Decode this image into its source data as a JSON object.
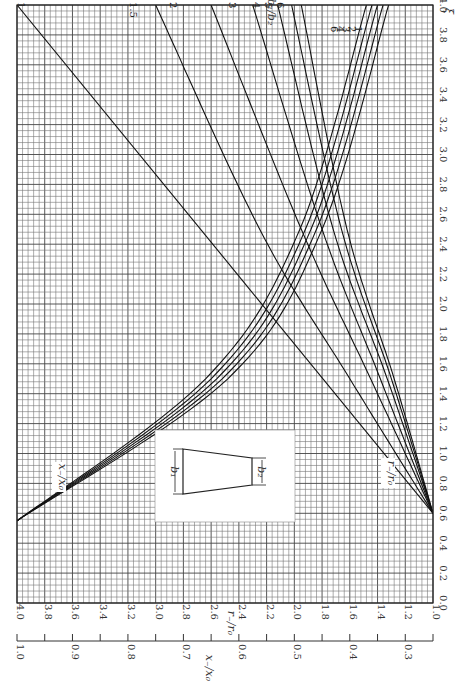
{
  "chart_data": {
    "type": "line",
    "title": "",
    "orientation": "rotated 90° (read with xi axis along right edge)",
    "xi_axis": {
      "label": "ξ",
      "range": [
        0.0,
        4.0
      ],
      "ticks": [
        "0.0",
        "0.2",
        "0.4",
        "0.6",
        "0.8",
        "1.0",
        "1.2",
        "1.4",
        "1.6",
        "1.8",
        "2.0",
        "2.2",
        "2.4",
        "2.6",
        "2.8",
        "3.0",
        "3.2",
        "3.4",
        "3.6",
        "3.8",
        "4.0"
      ]
    },
    "r_axis": {
      "label": "r₋/r₀",
      "range": [
        1.0,
        4.0
      ],
      "ticks": [
        "4.0",
        "3.8",
        "3.6",
        "3.4",
        "3.2",
        "3.0",
        "2.8",
        "2.6",
        "2.4",
        "2.2",
        "2.0",
        "1.8",
        "1.6",
        "1.4",
        "1.2",
        "1.0"
      ]
    },
    "x_axis": {
      "label": "x₋/x₀",
      "range": [
        0.25,
        1.0
      ],
      "ticks": [
        "1.0",
        "0.9",
        "0.8",
        "0.7",
        "0.6",
        "0.5",
        "0.4",
        "0.3"
      ]
    },
    "parameter": {
      "label": "b₁/b₂",
      "values": [
        "1",
        "1.5",
        "2",
        "3",
        "4",
        "5",
        "6"
      ]
    },
    "series_r": [
      {
        "name": "b1/b2=1",
        "xi": [
          0.6,
          4.0
        ],
        "r_over_r0": [
          1.0,
          4.0
        ]
      },
      {
        "name": "b1/b2=1.5",
        "xi": [
          0.6,
          1.5,
          2.5,
          4.0
        ],
        "r_over_r0": [
          1.0,
          1.6,
          2.25,
          3.0
        ]
      },
      {
        "name": "b1/b2=2",
        "xi": [
          0.6,
          1.5,
          2.5,
          4.0
        ],
        "r_over_r0": [
          1.0,
          1.45,
          1.95,
          2.6
        ]
      },
      {
        "name": "b1/b2=3",
        "xi": [
          0.6,
          1.5,
          2.5,
          4.0
        ],
        "r_over_r0": [
          1.0,
          1.38,
          1.8,
          2.3
        ]
      },
      {
        "name": "b1/b2=4",
        "xi": [
          0.6,
          1.5,
          2.5,
          4.0
        ],
        "r_over_r0": [
          1.0,
          1.33,
          1.72,
          2.12
        ]
      },
      {
        "name": "b1/b2=5",
        "xi": [
          0.6,
          1.5,
          2.5,
          4.0
        ],
        "r_over_r0": [
          1.0,
          1.3,
          1.66,
          2.02
        ]
      },
      {
        "name": "b1/b2=6",
        "xi": [
          0.6,
          1.5,
          2.5,
          4.0
        ],
        "r_over_r0": [
          1.0,
          1.28,
          1.62,
          1.95
        ]
      }
    ],
    "series_x": [
      {
        "name": "b1/b2=1",
        "xi": [
          0.55,
          1.5,
          2.5,
          4.0
        ],
        "x_over_x0": [
          1.0,
          0.62,
          0.45,
          0.33
        ]
      },
      {
        "name": "b1/b2=2",
        "xi": [
          0.55,
          1.5,
          2.5,
          4.0
        ],
        "x_over_x0": [
          1.0,
          0.63,
          0.46,
          0.34
        ]
      },
      {
        "name": "b1/b2=3",
        "xi": [
          0.55,
          1.5,
          2.5,
          4.0
        ],
        "x_over_x0": [
          1.0,
          0.64,
          0.47,
          0.35
        ]
      },
      {
        "name": "b1/b2=4",
        "xi": [
          0.55,
          1.5,
          2.5,
          4.0
        ],
        "x_over_x0": [
          1.0,
          0.65,
          0.48,
          0.36
        ]
      },
      {
        "name": "b1/b2=6",
        "xi": [
          0.55,
          1.5,
          2.5,
          4.0
        ],
        "x_over_x0": [
          1.0,
          0.66,
          0.49,
          0.37
        ]
      }
    ],
    "annotations": [
      "x₋/x₀",
      "r₋/r₀",
      "b₁",
      "b₂"
    ],
    "grid": true,
    "legend_position": "curve-end labels"
  },
  "labels": {
    "xi": "ξ",
    "param": "b₁/b₂",
    "r_axis_title": "r₋/r₀",
    "x_axis_title": "x₋/x₀",
    "x_curve_tag": "x₋/x₀",
    "r_curve_tag": "r₋/r₀",
    "inset_b1": "b₁",
    "inset_b2": "b₂"
  }
}
